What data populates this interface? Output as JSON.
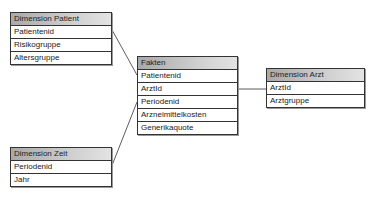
{
  "tables": {
    "patient": {
      "title": "Dimension Patient",
      "fields": [
        "Patientenid",
        "Risikogruppe",
        "Altersgruppe"
      ]
    },
    "fakten": {
      "title": "Fakten",
      "fields": [
        "Patientenid",
        "ArztId",
        "Periodenid",
        "Arzneimittelkosten",
        "Generikaquote"
      ]
    },
    "arzt": {
      "title": "Dimension Arzt",
      "fields": [
        "ArztId",
        "Arztgruppe"
      ]
    },
    "zeit": {
      "title": "Dimension Zeit",
      "fields": [
        "Periodenid",
        "Jahr"
      ]
    }
  },
  "relations": [
    {
      "from": "Dimension Patient.Patientenid",
      "to": "Fakten.Patientenid"
    },
    {
      "from": "Dimension Arzt.ArztId",
      "to": "Fakten.ArztId"
    },
    {
      "from": "Dimension Zeit.Periodenid",
      "to": "Fakten.Periodenid"
    }
  ]
}
